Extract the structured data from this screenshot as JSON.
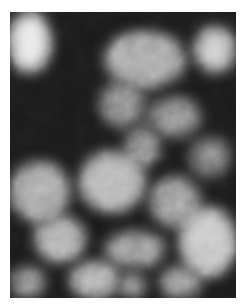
{
  "image": {
    "description": "Grayscale turbulent cloud/noise texture",
    "colors": {
      "dark": "#1a1a1a",
      "mid": "#7a7a7a",
      "light": "#d8d8d8",
      "border": "#ffffff"
    },
    "blobs": [
      {
        "x": 0,
        "y": 0,
        "w": 40,
        "h": 60,
        "c": "#e6e6e6"
      },
      {
        "x": 95,
        "y": 20,
        "w": 80,
        "h": 55,
        "c": "#a8a8a8"
      },
      {
        "x": 185,
        "y": 15,
        "w": 40,
        "h": 45,
        "c": "#c8c8c8"
      },
      {
        "x": 90,
        "y": 70,
        "w": 45,
        "h": 45,
        "c": "#8a8a8a"
      },
      {
        "x": 140,
        "y": 85,
        "w": 50,
        "h": 40,
        "c": "#8a8a8a"
      },
      {
        "x": 115,
        "y": 115,
        "w": 35,
        "h": 40,
        "c": "#8a8a8a"
      },
      {
        "x": 180,
        "y": 125,
        "w": 40,
        "h": 40,
        "c": "#7a7a7a"
      },
      {
        "x": 70,
        "y": 140,
        "w": 65,
        "h": 60,
        "c": "#b5b5b5"
      },
      {
        "x": 0,
        "y": 150,
        "w": 60,
        "h": 60,
        "c": "#a5a5a5"
      },
      {
        "x": 140,
        "y": 165,
        "w": 50,
        "h": 50,
        "c": "#999999"
      },
      {
        "x": 25,
        "y": 205,
        "w": 50,
        "h": 45,
        "c": "#b0b0b0"
      },
      {
        "x": 170,
        "y": 195,
        "w": 56,
        "h": 70,
        "c": "#c5c5c5"
      },
      {
        "x": 95,
        "y": 220,
        "w": 60,
        "h": 35,
        "c": "#9a9a9a"
      },
      {
        "x": 60,
        "y": 250,
        "w": 50,
        "h": 36,
        "c": "#b0b0b0"
      },
      {
        "x": 110,
        "y": 262,
        "w": 25,
        "h": 24,
        "c": "#9a9a9a"
      },
      {
        "x": 0,
        "y": 255,
        "w": 35,
        "h": 31,
        "c": "#8a8a8a"
      },
      {
        "x": 150,
        "y": 255,
        "w": 40,
        "h": 31,
        "c": "#9a9a9a"
      }
    ]
  }
}
